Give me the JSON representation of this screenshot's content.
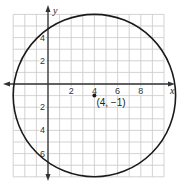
{
  "chart_data": {
    "type": "scatter",
    "title": "",
    "xlabel": "x",
    "ylabel": "y",
    "xlim": [
      -3,
      10
    ],
    "ylim": [
      -8,
      6
    ],
    "grid": true,
    "x_ticks": [
      2,
      4,
      6,
      8
    ],
    "y_ticks": [
      4,
      2,
      -2,
      -4,
      -6
    ],
    "x_tick_labels": [
      "2",
      "4",
      "6",
      "8"
    ],
    "y_tick_labels": [
      "4",
      "2",
      "2",
      "4",
      "6"
    ],
    "circle": {
      "center": [
        4,
        -1
      ],
      "radius": 7
    },
    "points": [
      {
        "x": 4,
        "y": -1,
        "label": "(4, −1)"
      }
    ],
    "colors": {
      "grid": "#c8c8c8",
      "axis": "#333333",
      "curve": "#1a1a1a"
    }
  }
}
